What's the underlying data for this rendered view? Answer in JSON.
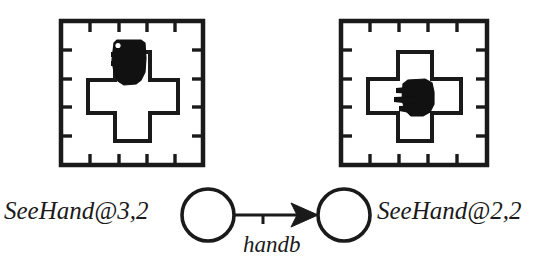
{
  "diagram": {
    "type": "state-transition-diagram",
    "title": "",
    "background_color": "#ffffff",
    "stroke_color": "#1a1a1a",
    "fill_color": "#000000",
    "states": [
      {
        "id": "state-source",
        "label": "SeeHand@3,2",
        "position": "left",
        "hand_cell": "3,2",
        "node_center": [
          208,
          215
        ],
        "node_radius": 26
      },
      {
        "id": "state-target",
        "label": "SeeHand@2,2",
        "position": "right",
        "hand_cell": "2,2",
        "node_center": [
          344,
          215
        ],
        "node_radius": 26
      }
    ],
    "transition": {
      "id": "transition-handb",
      "label": "handb",
      "from": "state-source",
      "to": "state-target",
      "arrow_style": "barbed"
    },
    "panels": [
      {
        "id": "panel-left",
        "caption_for": "SeeHand@3,2",
        "frame": {
          "x": 61,
          "y": 21,
          "w": 142,
          "h": 144
        },
        "ticks_per_side": 4,
        "tick_length": 9,
        "shape": "cross",
        "hand_position": "top-arm",
        "hand_label": "hand-blob"
      },
      {
        "id": "panel-right",
        "caption_for": "SeeHand@2,2",
        "frame": {
          "x": 341,
          "y": 21,
          "w": 146,
          "h": 144
        },
        "ticks_per_side": 4,
        "tick_length": 9,
        "shape": "cross",
        "hand_position": "center",
        "hand_label": "hand-blob"
      }
    ],
    "icons": {
      "hand": "hand-icon",
      "cross": "cross-shape-icon",
      "grid_frame": "grid-frame-icon",
      "arrow": "arrow-right-icon"
    }
  }
}
